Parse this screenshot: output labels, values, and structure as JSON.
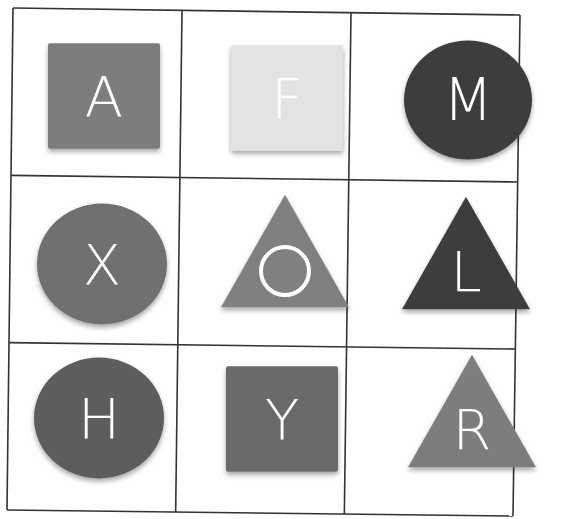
{
  "grid": {
    "rows": 3,
    "cols": 3,
    "line_color": "#333333",
    "corners": {
      "top_left": [
        13,
        8
      ],
      "top_right": [
        520,
        15
      ],
      "bottom_left": [
        7,
        510
      ],
      "bottom_right": [
        513,
        516
      ]
    }
  },
  "cells": [
    {
      "row": 0,
      "col": 0,
      "shape": "square",
      "letter": "A",
      "color": "#7d7d7d",
      "cx": 104,
      "cy": 96,
      "size": 112
    },
    {
      "row": 0,
      "col": 1,
      "shape": "square",
      "letter": "F",
      "color": "#e3e3e3",
      "cx": 287,
      "cy": 98,
      "size": 112
    },
    {
      "row": 0,
      "col": 2,
      "shape": "circle",
      "letter": "M",
      "color": "#3d3d3d",
      "cx": 468,
      "cy": 100,
      "size": 128
    },
    {
      "row": 1,
      "col": 0,
      "shape": "circle",
      "letter": "X",
      "color": "#6f6f6f",
      "cx": 102,
      "cy": 264,
      "size": 130
    },
    {
      "row": 1,
      "col": 1,
      "shape": "triangle",
      "letter": "O",
      "color": "#808080",
      "cx": 285,
      "cy": 260,
      "size": 128
    },
    {
      "row": 1,
      "col": 2,
      "shape": "triangle",
      "letter": "L",
      "color": "#3d3d3d",
      "cx": 466,
      "cy": 262,
      "size": 128
    },
    {
      "row": 2,
      "col": 0,
      "shape": "circle",
      "letter": "H",
      "color": "#5d5d5d",
      "cx": 99,
      "cy": 418,
      "size": 130
    },
    {
      "row": 2,
      "col": 1,
      "shape": "square",
      "letter": "Y",
      "color": "#6b6b6b",
      "cx": 282,
      "cy": 419,
      "size": 112
    },
    {
      "row": 2,
      "col": 2,
      "shape": "triangle",
      "letter": "R",
      "color": "#7d7d7d",
      "cx": 472,
      "cy": 420,
      "size": 128
    }
  ]
}
